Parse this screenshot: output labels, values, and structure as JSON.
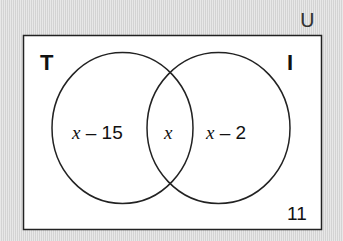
{
  "universal_symbol": "U",
  "sets": {
    "left": {
      "label": "T"
    },
    "right": {
      "label": "I"
    }
  },
  "regions": {
    "left_only": {
      "variable": "x",
      "rest": " – 15"
    },
    "intersection": {
      "variable": "x"
    },
    "right_only": {
      "variable": "x",
      "rest": " – 2"
    },
    "outside": "11"
  },
  "colors": {
    "background": "#dcdcdc",
    "box_fill": "#ffffff",
    "stroke": "#222222"
  }
}
